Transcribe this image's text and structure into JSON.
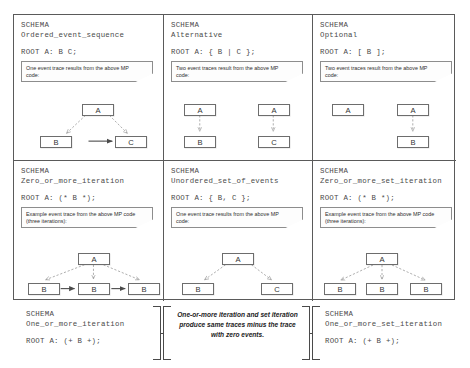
{
  "meta": {
    "colors": {
      "border": "#5a5a5a",
      "box_border": "#6d6d6d",
      "dashed_arrow": "#9a9a9a",
      "solid_arrow": "#4a4a4a",
      "text": "#3b3b3b",
      "background": "#ffffff"
    }
  },
  "cells": [
    {
      "id": "ordered-event-sequence",
      "schema_label": "SCHEMA",
      "schema_name": "Ordered_event_sequence",
      "root": "ROOT A: B C;",
      "note": "One event trace results from the above MP code:",
      "trace": {
        "type": "ordered-sequence",
        "nodes": [
          "A",
          "B",
          "C"
        ],
        "dashed_edges": [
          [
            "A",
            "B"
          ],
          [
            "A",
            "C"
          ]
        ],
        "solid_edges": [
          [
            "B",
            "C"
          ]
        ]
      }
    },
    {
      "id": "alternative",
      "schema_label": "SCHEMA",
      "schema_name": "Alternative",
      "root": "ROOT A: { B | C };",
      "note": "Two event traces result from the above MP code:",
      "trace": {
        "type": "two-traces",
        "traces": [
          [
            "A",
            "B"
          ],
          [
            "A",
            "C"
          ]
        ],
        "dashed_edges": [
          [
            "A",
            "B"
          ],
          [
            "A",
            "C"
          ]
        ],
        "solid_edges": []
      }
    },
    {
      "id": "optional",
      "schema_label": "SCHEMA",
      "schema_name": "Optional",
      "root": "ROOT A: [ B ];",
      "note": "Two event traces result from the above MP code:",
      "trace": {
        "type": "two-traces",
        "traces": [
          [
            "A"
          ],
          [
            "A",
            "B"
          ]
        ],
        "dashed_edges": [
          [
            "A",
            "B"
          ]
        ],
        "solid_edges": []
      }
    },
    {
      "id": "zero-or-more-iteration",
      "schema_label": "SCHEMA",
      "schema_name": "Zero_or_more_iteration",
      "root": "ROOT A: (* B *);",
      "note": "Example event trace from the above MP code (three iterations):",
      "trace": {
        "type": "iteration",
        "nodes": [
          "A",
          "B",
          "B",
          "B"
        ],
        "dashed_edges": [
          [
            "A",
            "B1"
          ],
          [
            "A",
            "B2"
          ],
          [
            "A",
            "B3"
          ]
        ],
        "solid_edges": [
          [
            "B1",
            "B2"
          ],
          [
            "B2",
            "B3"
          ]
        ]
      }
    },
    {
      "id": "unordered-set-of-events",
      "schema_label": "SCHEMA",
      "schema_name": "Unordered_set_of_events",
      "root": "ROOT A: { B, C };",
      "note": "One event trace results from the above MP code:",
      "trace": {
        "type": "set",
        "nodes": [
          "A",
          "B",
          "C"
        ],
        "dashed_edges": [
          [
            "A",
            "B"
          ],
          [
            "A",
            "C"
          ]
        ],
        "solid_edges": []
      }
    },
    {
      "id": "zero-or-more-set-iteration",
      "schema_label": "SCHEMA",
      "schema_name": "Zero_or_more_set_iteration",
      "root": "ROOT A: (* B *);",
      "note": "Example event trace from the above MP code (three iterations):",
      "trace": {
        "type": "set-iteration",
        "nodes": [
          "A",
          "B",
          "B",
          "B"
        ],
        "dashed_edges": [
          [
            "A",
            "B1"
          ],
          [
            "A",
            "B2"
          ],
          [
            "A",
            "B3"
          ]
        ],
        "solid_edges": []
      }
    }
  ],
  "bottom": {
    "left": {
      "id": "one-or-more-iteration",
      "schema_label": "SCHEMA",
      "schema_name": "One_or_more_iteration",
      "root": "ROOT A: (+ B +);"
    },
    "middle": {
      "id": "iteration-note",
      "text": "One-or-more iteration and set iteration produce same traces minus the trace with zero events."
    },
    "right": {
      "id": "one-or-more-set-iteration",
      "schema_label": "SCHEMA",
      "schema_name": "One_or_more_set_iteration",
      "root": "ROOT A: (+ B +);"
    }
  }
}
